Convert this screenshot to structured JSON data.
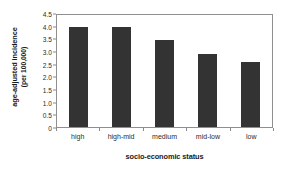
{
  "chart_data": {
    "type": "bar",
    "title": "",
    "categories": [
      "high",
      "high-mid",
      "medium",
      "mid-low",
      "low"
    ],
    "values": [
      3.95,
      3.95,
      3.45,
      2.88,
      2.55
    ],
    "xlabel": "socio-economic status",
    "ylabel": "age-adjusted incidence",
    "ylabel_line2": "(per 100,000)",
    "ylim": [
      0,
      4.5
    ],
    "yticks": [
      "0",
      "0.5",
      "1.0",
      "1.5",
      "2.0",
      "2.5",
      "3.0",
      "3.5",
      "4.0",
      "4.5"
    ],
    "ytick_values": [
      0,
      0.5,
      1.0,
      1.5,
      2.0,
      2.5,
      3.0,
      3.5,
      4.0,
      4.5
    ],
    "grid": false,
    "legend": null,
    "bar_color": "#333333",
    "frame_color": "#8f8f8f",
    "background": "#ffffff"
  }
}
